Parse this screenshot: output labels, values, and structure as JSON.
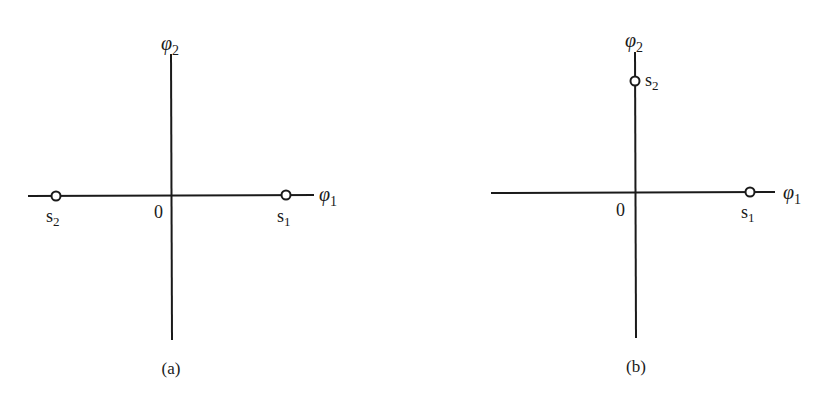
{
  "figure": {
    "panels": [
      {
        "caption": "(a)",
        "axis_labels": {
          "horizontal": "φ",
          "horizontal_sub": "1",
          "vertical": "φ",
          "vertical_sub": "2"
        },
        "origin_label": "0",
        "points": [
          {
            "name": "s",
            "sub": "1",
            "coords": [
              1,
              0
            ]
          },
          {
            "name": "s",
            "sub": "2",
            "coords": [
              -1,
              0
            ]
          }
        ]
      },
      {
        "caption": "(b)",
        "axis_labels": {
          "horizontal": "φ",
          "horizontal_sub": "1",
          "vertical": "φ",
          "vertical_sub": "2"
        },
        "origin_label": "0",
        "points": [
          {
            "name": "s",
            "sub": "1",
            "coords": [
              1,
              0
            ]
          },
          {
            "name": "s",
            "sub": "2",
            "coords": [
              0,
              1
            ]
          }
        ]
      }
    ]
  },
  "colors": {
    "ink": "#1a1a1a",
    "background": "#ffffff"
  }
}
